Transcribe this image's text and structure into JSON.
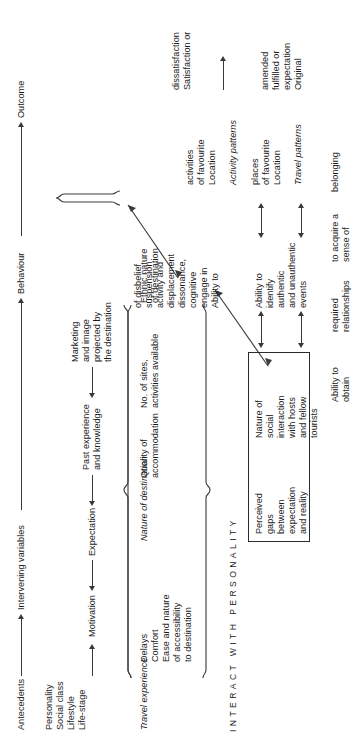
{
  "diagram": {
    "stage_labels": {
      "antecedents": "Antecedents",
      "intervening": "Intervening variables",
      "behaviour": "Behaviour",
      "outcome": "Outcome"
    },
    "antecedents": {
      "personal": [
        "Personality",
        "Social class",
        "Lifestyle",
        "Life-stage"
      ],
      "motivation": "Motivation",
      "expectation": "Expectation",
      "past_experience": [
        "Past experience",
        "and knowledge"
      ],
      "marketing": [
        "Marketing",
        "and image",
        "projected by",
        "the destination"
      ]
    },
    "intervening": {
      "travel_experience_heading": "Travel experience",
      "travel_experience_items": [
        "Delays",
        "Comfort",
        "Ease and nature",
        "of accessibility",
        "to destination"
      ],
      "nature_heading": "Nature of destination",
      "nature_items_1": [
        "Quality of",
        "accommodation"
      ],
      "nature_items_2": [
        "No. of sites,",
        "activities available"
      ],
      "ethnic": [
        "Ethnic nature",
        "of destination"
      ]
    },
    "interaction_letters": "INTERACT WITH PERSONALITY",
    "interaction_letters_list": [
      "I",
      "N",
      "T",
      "E",
      "R",
      "A",
      "C",
      "T",
      "W",
      "I",
      "T",
      "H",
      "P",
      "E",
      "R",
      "S",
      "O",
      "N",
      "A",
      "L",
      "I",
      "T",
      "Y"
    ],
    "core_box": {
      "item1": [
        "Perceived",
        "gaps",
        "between",
        "expectation",
        "and reality"
      ],
      "item2": [
        "Nature of",
        "social",
        "interaction",
        "with hosts",
        "and fellow",
        "tourists"
      ]
    },
    "abilities": {
      "ability1": [
        "Ability to",
        "identify",
        "authentic",
        "and unauthentic",
        "events"
      ],
      "ability2": [
        "Ability to",
        "engage in",
        "cognitive",
        "dissonance,",
        "displacement",
        "activity and",
        "suspension",
        "of disbelief"
      ],
      "ability3": [
        "Ability to",
        "obtain",
        "required",
        "relationships",
        "to acquire a",
        "sense of",
        "belonging"
      ]
    },
    "behaviour": {
      "travel_patterns_heading": "Travel patterns",
      "travel_patterns_items": [
        "Location",
        "of favourite",
        "places"
      ],
      "activity_patterns_heading": "Activity patterns",
      "activity_patterns_items": [
        "Location",
        "of favourite",
        "activities"
      ]
    },
    "outcome": {
      "original": [
        "Original",
        "expectation",
        "fulfilled or",
        "amended"
      ],
      "satisfaction": [
        "Satisfaction or",
        "dissatisfaction"
      ]
    },
    "colors": {
      "ink": "#1a1a1a",
      "line": "#3a3a3a",
      "background": "#ffffff"
    }
  }
}
